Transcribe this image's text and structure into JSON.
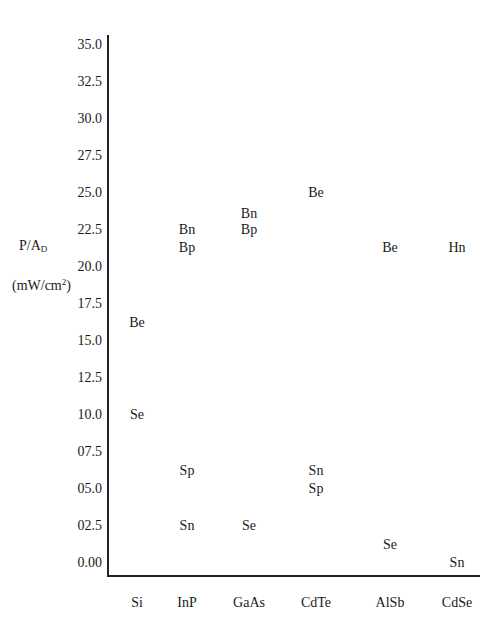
{
  "chart_data": {
    "type": "scatter",
    "title": "",
    "xlabel": "",
    "ylabel": "P/A_D (mW/cm^2)",
    "ylabel_parts": {
      "line1_main": "P/A",
      "line1_sub": "D",
      "line2_pre": "(mW/cm",
      "line2_sup": "2",
      "line2_post": ")"
    },
    "ylim": [
      0,
      35
    ],
    "grid": false,
    "legend": null,
    "yticks": [
      "35.0",
      "32.5",
      "30.0",
      "27.5",
      "25.0",
      "22.5",
      "20.0",
      "17.5",
      "15.0",
      "12.5",
      "10.0",
      "07.5",
      "05.0",
      "02.5",
      "0.00"
    ],
    "categories": [
      "Si",
      "InP",
      "GaAs",
      "CdTe",
      "AlSb",
      "CdSe"
    ],
    "points": [
      {
        "category": "Si",
        "label": "Be",
        "y": 16.2
      },
      {
        "category": "Si",
        "label": "Se",
        "y": 10.0
      },
      {
        "category": "InP",
        "label": "Bn",
        "y": 22.5
      },
      {
        "category": "InP",
        "label": "Bp",
        "y": 21.3
      },
      {
        "category": "InP",
        "label": "Sp",
        "y": 6.2
      },
      {
        "category": "InP",
        "label": "Sn",
        "y": 2.5
      },
      {
        "category": "GaAs",
        "label": "Bn",
        "y": 23.6
      },
      {
        "category": "GaAs",
        "label": "Bp",
        "y": 22.5
      },
      {
        "category": "GaAs",
        "label": "Se",
        "y": 2.5
      },
      {
        "category": "CdTe",
        "label": "Be",
        "y": 25.0
      },
      {
        "category": "CdTe",
        "label": "Sn",
        "y": 6.2
      },
      {
        "category": "CdTe",
        "label": "Sp",
        "y": 5.0
      },
      {
        "category": "AlSb",
        "label": "Be",
        "y": 21.3
      },
      {
        "category": "AlSb",
        "label": "Se",
        "y": 1.2
      },
      {
        "category": "CdSe",
        "label": "Hn",
        "y": 21.3
      },
      {
        "category": "CdSe",
        "label": "Sn",
        "y": 0.0
      }
    ]
  }
}
